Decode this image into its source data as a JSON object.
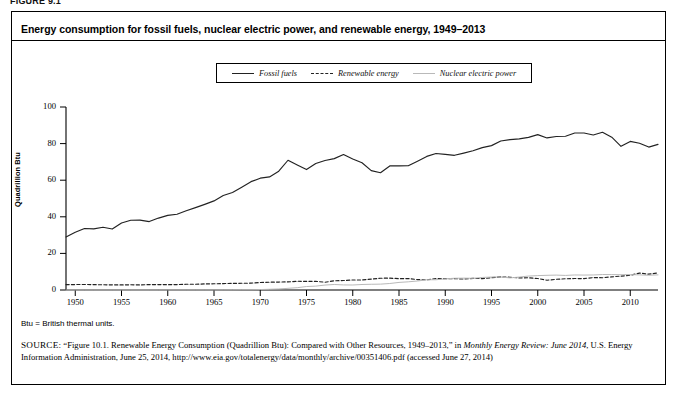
{
  "figure": {
    "label": "FIGURE 9.1",
    "title": "Energy consumption for fossil fuels, nuclear electric power, and renewable energy, 1949–2013",
    "btu_note": "Btu = British thermal units.",
    "source_caps": "SOURCE:",
    "source_part1": " “Figure 10.1. Renewable Energy Consumption (Quadrillion Btu): Compared with Other Resources, 1949–2013,” in ",
    "source_italic1": "Monthly Energy Review: June 2014",
    "source_part2": ", U.S. Energy Information Administration, June 25, 2014, http://www.eia.gov/totalenergy/data/monthly/archive/00351406.pdf (accessed June 27, 2014)"
  },
  "legend": {
    "items": [
      {
        "label": "Fossil fuels",
        "style": "solid",
        "color": "#222222"
      },
      {
        "label": "Renewable energy",
        "style": "dashed",
        "color": "#222222"
      },
      {
        "label": "Nuclear electric power",
        "style": "solid-gray",
        "color": "#b9b9b9"
      }
    ]
  },
  "chart_data": {
    "type": "line",
    "title": "Energy consumption for fossil fuels, nuclear electric power, and renewable energy, 1949–2013",
    "xlabel": "",
    "ylabel": "Quadrillion Btu",
    "xlim": [
      1949,
      2013
    ],
    "ylim": [
      0,
      100
    ],
    "yticks": [
      0,
      20,
      40,
      60,
      80,
      100
    ],
    "xticks": [
      1950,
      1955,
      1960,
      1965,
      1970,
      1975,
      1980,
      1985,
      1990,
      1995,
      2000,
      2005,
      2010
    ],
    "grid": false,
    "legend_position": "top-center",
    "x": [
      1949,
      1950,
      1951,
      1952,
      1953,
      1954,
      1955,
      1956,
      1957,
      1958,
      1959,
      1960,
      1961,
      1962,
      1963,
      1964,
      1965,
      1966,
      1967,
      1968,
      1969,
      1970,
      1971,
      1972,
      1973,
      1974,
      1975,
      1976,
      1977,
      1978,
      1979,
      1980,
      1981,
      1982,
      1983,
      1984,
      1985,
      1986,
      1987,
      1988,
      1989,
      1990,
      1991,
      1992,
      1993,
      1994,
      1995,
      1996,
      1997,
      1998,
      1999,
      2000,
      2001,
      2002,
      2003,
      2004,
      2005,
      2006,
      2007,
      2008,
      2009,
      2010,
      2011,
      2012,
      2013
    ],
    "series": [
      {
        "name": "Fossil fuels",
        "style": "solid",
        "color": "#222222",
        "values": [
          29.0,
          31.6,
          33.6,
          33.4,
          34.3,
          33.3,
          36.6,
          38.1,
          38.2,
          37.4,
          39.3,
          40.8,
          41.4,
          43.3,
          45.0,
          46.8,
          48.7,
          51.6,
          53.3,
          56.2,
          59.2,
          61.1,
          61.8,
          64.9,
          70.9,
          68.3,
          65.8,
          69.1,
          70.8,
          71.8,
          74.0,
          71.6,
          69.5,
          65.2,
          64.1,
          67.8,
          67.8,
          67.9,
          70.4,
          73.0,
          74.6,
          74.1,
          73.6,
          74.8,
          76.1,
          77.8,
          78.9,
          81.4,
          82.2,
          82.6,
          83.4,
          84.9,
          83.1,
          83.9,
          84.0,
          85.8,
          85.8,
          84.7,
          86.2,
          83.5,
          78.5,
          81.2,
          80.2,
          78.1,
          79.6
        ]
      },
      {
        "name": "Renewable energy",
        "style": "dashed",
        "color": "#222222",
        "values": [
          2.97,
          2.98,
          3.0,
          2.94,
          2.85,
          2.82,
          2.78,
          2.86,
          2.78,
          2.94,
          2.95,
          2.93,
          2.96,
          3.14,
          3.15,
          3.32,
          3.4,
          3.49,
          3.61,
          3.66,
          3.75,
          4.08,
          4.25,
          4.34,
          4.43,
          4.77,
          4.72,
          4.75,
          4.25,
          5.04,
          5.17,
          5.49,
          5.48,
          5.97,
          6.42,
          6.49,
          6.19,
          6.24,
          5.7,
          5.55,
          6.24,
          6.21,
          6.18,
          6.0,
          6.34,
          6.22,
          6.7,
          7.17,
          6.98,
          6.63,
          6.68,
          6.26,
          5.33,
          5.84,
          6.15,
          6.26,
          6.23,
          6.79,
          6.7,
          7.19,
          7.57,
          8.09,
          9.24,
          8.64,
          9.3
        ]
      },
      {
        "name": "Nuclear electric power",
        "style": "solid-gray",
        "color": "#b9b9b9",
        "values": [
          0,
          0,
          0,
          0,
          0,
          0,
          0,
          0,
          0,
          0,
          0,
          0.01,
          0.02,
          0.03,
          0.04,
          0.04,
          0.04,
          0.06,
          0.09,
          0.14,
          0.15,
          0.24,
          0.41,
          0.58,
          0.91,
          1.27,
          1.9,
          2.11,
          2.7,
          3.02,
          2.78,
          2.74,
          3.01,
          3.13,
          3.2,
          3.55,
          4.15,
          4.47,
          4.91,
          5.59,
          5.6,
          6.1,
          6.42,
          6.48,
          6.41,
          6.84,
          7.08,
          7.09,
          6.6,
          7.07,
          7.61,
          7.86,
          8.03,
          8.14,
          7.96,
          8.22,
          8.16,
          8.22,
          8.46,
          8.43,
          8.35,
          8.43,
          8.26,
          8.06,
          8.27
        ]
      }
    ]
  }
}
